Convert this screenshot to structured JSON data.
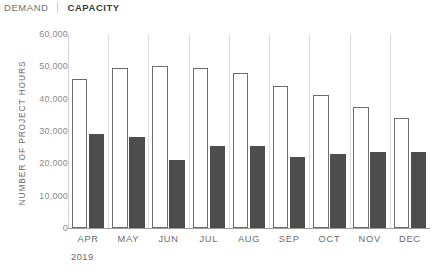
{
  "legend": {
    "demand_label": "DEMAND",
    "capacity_label": "CAPACITY",
    "demand_color": "#ffffff",
    "demand_border_color": "#6d6d6d",
    "capacity_color": "#4d4d4d"
  },
  "axes": {
    "ylabel": "NUMBER OF PROJECT HOURS",
    "year": "2019"
  },
  "chart_data": {
    "type": "bar",
    "title": "",
    "subtitle": "",
    "xlabel": "2019",
    "ylabel": "NUMBER OF PROJECT HOURS",
    "categories": [
      "APR",
      "MAY",
      "JUN",
      "JUL",
      "AUG",
      "SEP",
      "OCT",
      "NOV",
      "DEC"
    ],
    "series": [
      {
        "name": "DEMAND",
        "color": "#ffffff",
        "border_color": "#6d6d6d",
        "values": [
          46000,
          49500,
          50000,
          49500,
          48000,
          44000,
          41000,
          37500,
          34000
        ]
      },
      {
        "name": "CAPACITY",
        "color": "#4d4d4d",
        "values": [
          29000,
          28000,
          21000,
          25500,
          25500,
          22000,
          23000,
          23500,
          23500
        ]
      }
    ],
    "ylim": [
      0,
      60000
    ],
    "yticks": [
      0,
      10000,
      20000,
      30000,
      40000,
      50000,
      60000
    ],
    "ytick_labels": [
      "0",
      "10,000",
      "20,000",
      "30,000",
      "40,000",
      "50,000",
      "60,000"
    ],
    "grid": false,
    "legend_position": "top-left"
  }
}
